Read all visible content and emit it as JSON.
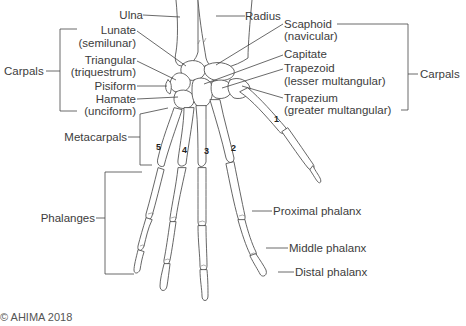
{
  "diagram": {
    "labels_left": {
      "ulna": "Ulna",
      "lunate": "Lunate",
      "lunate_alt": "(semilunar)",
      "triangular": "Triangular",
      "triangular_alt": "(triquestrum)",
      "pisiform": "Pisiform",
      "hamate": "Hamate",
      "hamate_alt": "(unciform)",
      "carpals": "Carpals",
      "metacarpals": "Metacarpals",
      "phalanges": "Phalanges"
    },
    "labels_right": {
      "radius": "Radius",
      "scaphoid": "Scaphoid",
      "scaphoid_alt": "(navicular)",
      "capitate": "Capitate",
      "trapezoid": "Trapezoid",
      "trapezoid_alt": "(lesser multangular)",
      "trapezium": "Trapezium",
      "trapezium_alt": "(greater multangular)",
      "carpals": "Carpals",
      "proximal_phalanx": "Proximal phalanx",
      "middle_phalanx": "Middle phalanx",
      "distal_phalanx": "Distal phalanx"
    },
    "metacarpal_numbers": [
      "1",
      "2",
      "3",
      "4",
      "5"
    ],
    "copyright": "© AHIMA 2018"
  },
  "colors": {
    "line": "#4a4a4a",
    "bone_fill": "#ffffff",
    "text": "#3c3c3c"
  }
}
